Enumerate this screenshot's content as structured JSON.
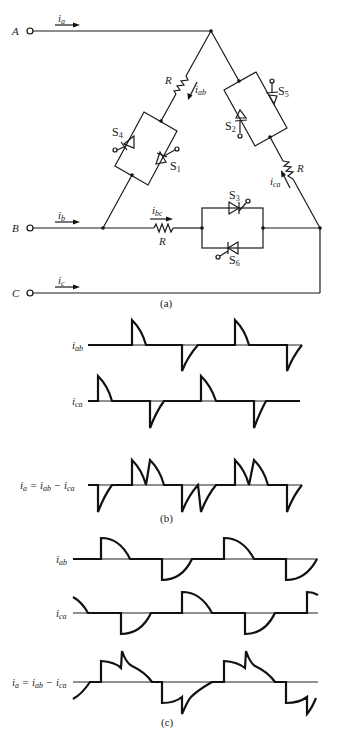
{
  "figure": {
    "panel_a": {
      "caption": "(a)",
      "terminals": [
        {
          "name": "A",
          "current": "i",
          "current_sub": "a"
        },
        {
          "name": "B",
          "current": "i",
          "current_sub": "b"
        },
        {
          "name": "C",
          "current": "i",
          "current_sub": "c"
        }
      ],
      "branches": {
        "ab": {
          "resistor": "R",
          "current": "i",
          "current_sub": "ab",
          "switches": [
            {
              "label": "S",
              "sub": "4"
            },
            {
              "label": "S",
              "sub": "1"
            }
          ]
        },
        "bc": {
          "resistor": "R",
          "current": "i",
          "current_sub": "bc",
          "switches": [
            {
              "label": "S",
              "sub": "3"
            },
            {
              "label": "S",
              "sub": "6"
            }
          ]
        },
        "ca": {
          "resistor": "R",
          "current": "i",
          "current_sub": "ca",
          "switches": [
            {
              "label": "S",
              "sub": "5"
            },
            {
              "label": "S",
              "sub": "2"
            }
          ]
        }
      }
    },
    "panel_b": {
      "caption": "(b)",
      "traces": [
        {
          "label": "i",
          "sub": "ab",
          "suffix": ""
        },
        {
          "label": "i",
          "sub": "ca",
          "suffix": ""
        },
        {
          "label": "i",
          "sub": "a",
          "suffix": " = i",
          "sub2": "ab",
          "suffix2": " − i",
          "sub3": "ca"
        }
      ]
    },
    "panel_c": {
      "caption": "(c)",
      "traces": [
        {
          "label": "i",
          "sub": "ab"
        },
        {
          "label": "i",
          "sub": "ca"
        },
        {
          "label": "i",
          "sub": "a",
          "suffix": " = i",
          "sub2": "ab",
          "suffix2": " − i",
          "sub3": "ca"
        }
      ]
    }
  }
}
